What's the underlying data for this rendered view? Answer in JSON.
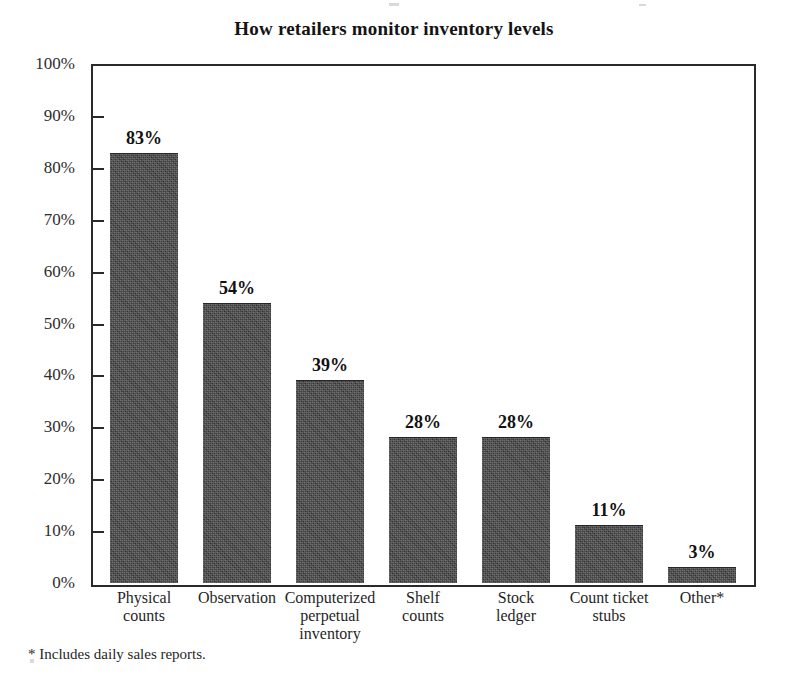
{
  "chart_data": {
    "type": "bar",
    "title": "How retailers monitor inventory levels",
    "xlabel": "",
    "ylabel": "",
    "ylim": [
      0,
      100
    ],
    "grid": false,
    "legend": "none",
    "categories": [
      "Physical counts",
      "Observation",
      "Computerized perpetual inventory",
      "Shelf counts",
      "Stock ledger",
      "Count ticket stubs",
      "Other*"
    ],
    "category_lines": [
      [
        "Physical",
        "counts"
      ],
      [
        "Observation"
      ],
      [
        "Computerized",
        "perpetual",
        "inventory"
      ],
      [
        "Shelf",
        "counts"
      ],
      [
        "Stock",
        "ledger"
      ],
      [
        "Count ticket",
        "stubs"
      ],
      [
        "Other*"
      ]
    ],
    "values": [
      83,
      54,
      39,
      28,
      28,
      11,
      3
    ],
    "value_labels": [
      "83%",
      "54%",
      "39%",
      "28%",
      "28%",
      "11%",
      "3%"
    ],
    "y_ticks": [
      0,
      10,
      20,
      30,
      40,
      50,
      60,
      70,
      80,
      90,
      100
    ],
    "y_tick_labels": [
      "0%",
      "10%",
      "20%",
      "30%",
      "40%",
      "50%",
      "60%",
      "70%",
      "80%",
      "90%",
      "100%"
    ],
    "bar_color": "#3c3c3c",
    "axis_color": "#2a2a2a",
    "background_color": "#ffffff",
    "footnote": "* Includes daily sales reports."
  }
}
